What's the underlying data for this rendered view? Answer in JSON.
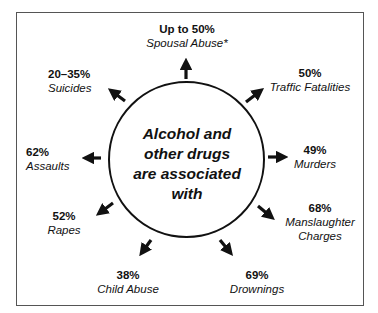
{
  "center": {
    "lines": [
      "Alcohol and",
      "other drugs",
      "are associated",
      "with"
    ]
  },
  "items": [
    {
      "percent": "Up to 50%",
      "category": "Spousal Abuse*"
    },
    {
      "percent": "50%",
      "category": "Traffic Fatalities"
    },
    {
      "percent": "49%",
      "category": "Murders"
    },
    {
      "percent": "68%",
      "category": "Manslaughter Charges",
      "category_lines": [
        "Manslaughter",
        "Charges"
      ]
    },
    {
      "percent": "69%",
      "category": "Drownings"
    },
    {
      "percent": "38%",
      "category": "Child Abuse"
    },
    {
      "percent": "52%",
      "category": "Rapes"
    },
    {
      "percent": "62%",
      "category": "Assaults"
    },
    {
      "percent": "20–35%",
      "category": "Suicides"
    }
  ],
  "colors": {
    "ink": "#111111",
    "frame": "#555555",
    "background": "#ffffff"
  }
}
